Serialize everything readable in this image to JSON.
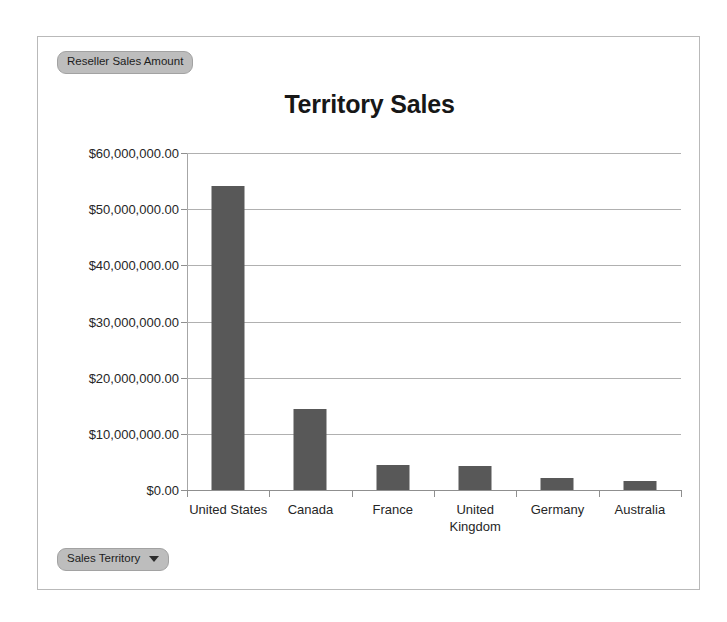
{
  "legend": {
    "field_label": "Reseller Sales Amount"
  },
  "category_field": {
    "label": "Sales Territory",
    "caret_icon": "chevron-down-icon"
  },
  "chart_data": {
    "type": "bar",
    "title": "Territory Sales",
    "xlabel": "",
    "ylabel": "",
    "categories": [
      "United States",
      "Canada",
      "France",
      "United Kingdom",
      "Germany",
      "Australia"
    ],
    "values": [
      54100000,
      14400000,
      4450000,
      4300000,
      2100000,
      1600000
    ],
    "series": [
      {
        "name": "Reseller Sales Amount",
        "values": [
          54100000,
          14400000,
          4450000,
          4300000,
          2100000,
          1600000
        ]
      }
    ],
    "ylim": [
      0,
      60000000
    ],
    "ytick_values": [
      60000000,
      50000000,
      40000000,
      30000000,
      20000000,
      10000000,
      0
    ],
    "ytick_labels": [
      "$60,000,000.00",
      "$50,000,000.00",
      "$40,000,000.00",
      "$30,000,000.00",
      "$20,000,000.00",
      "$10,000,000.00",
      "$0.00"
    ],
    "grid": true,
    "legend_position": "top-left",
    "bar_color": "#585858",
    "gridline_color": "#b0b0b0",
    "axis_color": "#8f8f8f"
  }
}
